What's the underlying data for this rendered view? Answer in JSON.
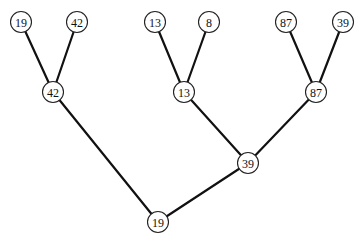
{
  "diagram": {
    "type": "tournament-tree",
    "node_radius": 10.5,
    "colors": {
      "edge": "#111111",
      "node_stroke": "#222222",
      "node_fill": "#ffffff",
      "text": "#111111"
    },
    "nodes": [
      {
        "id": "leaf1",
        "label": "19",
        "x": 21,
        "y": 22
      },
      {
        "id": "leaf2",
        "label": "42",
        "x": 77,
        "y": 22
      },
      {
        "id": "leaf3",
        "label": "13",
        "x": 155,
        "y": 22
      },
      {
        "id": "leaf4",
        "label": "8",
        "x": 209,
        "y": 22
      },
      {
        "id": "leaf5",
        "label": "87",
        "x": 286,
        "y": 22
      },
      {
        "id": "leaf6",
        "label": "39",
        "x": 343,
        "y": 22
      },
      {
        "id": "mid1",
        "label": "42",
        "x": 53,
        "y": 92
      },
      {
        "id": "mid2",
        "label": "13",
        "x": 184,
        "y": 92
      },
      {
        "id": "mid3",
        "label": "87",
        "x": 316,
        "y": 92
      },
      {
        "id": "upper",
        "label": "39",
        "x": 248,
        "y": 163
      },
      {
        "id": "root",
        "label": "19",
        "x": 158,
        "y": 222
      }
    ],
    "edges": [
      [
        "leaf1",
        "mid1"
      ],
      [
        "leaf2",
        "mid1"
      ],
      [
        "leaf3",
        "mid2"
      ],
      [
        "leaf4",
        "mid2"
      ],
      [
        "leaf5",
        "mid3"
      ],
      [
        "leaf6",
        "mid3"
      ],
      [
        "mid2",
        "upper"
      ],
      [
        "mid3",
        "upper"
      ],
      [
        "mid1",
        "root"
      ],
      [
        "upper",
        "root"
      ]
    ]
  }
}
